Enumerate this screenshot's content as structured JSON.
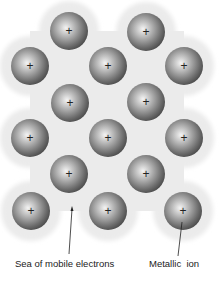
{
  "diagram": {
    "sea_color": "#ebebeb",
    "ion_radius": 19,
    "ion_symbol": "+",
    "ions": [
      {
        "x": 69,
        "y": 31
      },
      {
        "x": 146,
        "y": 32
      },
      {
        "x": 30,
        "y": 66
      },
      {
        "x": 108,
        "y": 66
      },
      {
        "x": 184,
        "y": 66
      },
      {
        "x": 70,
        "y": 103
      },
      {
        "x": 146,
        "y": 102
      },
      {
        "x": 30,
        "y": 138
      },
      {
        "x": 108,
        "y": 138
      },
      {
        "x": 184,
        "y": 138
      },
      {
        "x": 69,
        "y": 174
      },
      {
        "x": 146,
        "y": 174
      },
      {
        "x": 31,
        "y": 211
      },
      {
        "x": 108,
        "y": 211
      },
      {
        "x": 183,
        "y": 211
      }
    ],
    "labels": {
      "sea": "Sea of mobile electrons",
      "ion": "Metallic  ion"
    }
  }
}
